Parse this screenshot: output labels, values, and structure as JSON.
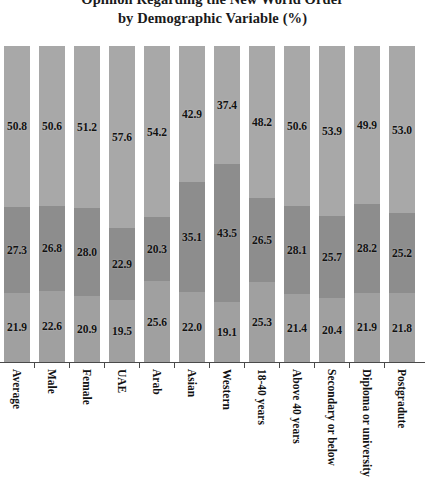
{
  "chart_data": {
    "type": "bar",
    "title": "Opinion Regarding the New World Order by Demographic Variable (%)",
    "title_lines": [
      "Opinion Regarding the New World Order",
      "by Demographic Variable (%)"
    ],
    "xlabel": "",
    "ylabel": "",
    "ylim": [
      0,
      100
    ],
    "grid": false,
    "legend": "none",
    "stacked": true,
    "stacked_percent": true,
    "categories": [
      "Average",
      "Male",
      "Female",
      "UAE",
      "Arab",
      "Asian",
      "Western",
      "18-40 years",
      "Above 40 years",
      "Secondary or below",
      "Diploma or university",
      "Postgradute"
    ],
    "series": [
      {
        "name": "bottom-segment",
        "color": "#a0a0a0",
        "values": [
          21.9,
          22.6,
          20.9,
          19.5,
          25.6,
          22.0,
          19.1,
          25.3,
          21.4,
          20.4,
          21.9,
          21.8
        ]
      },
      {
        "name": "middle-segment",
        "color": "#8d8d8d",
        "values": [
          27.3,
          26.8,
          28.0,
          22.9,
          20.3,
          35.1,
          43.5,
          26.5,
          28.1,
          25.7,
          28.2,
          25.2
        ]
      },
      {
        "name": "top-segment",
        "color": "#a8a8a8",
        "values": [
          50.8,
          50.6,
          51.2,
          57.6,
          54.2,
          42.9,
          37.4,
          48.2,
          50.6,
          53.9,
          49.9,
          53.0
        ]
      }
    ]
  }
}
